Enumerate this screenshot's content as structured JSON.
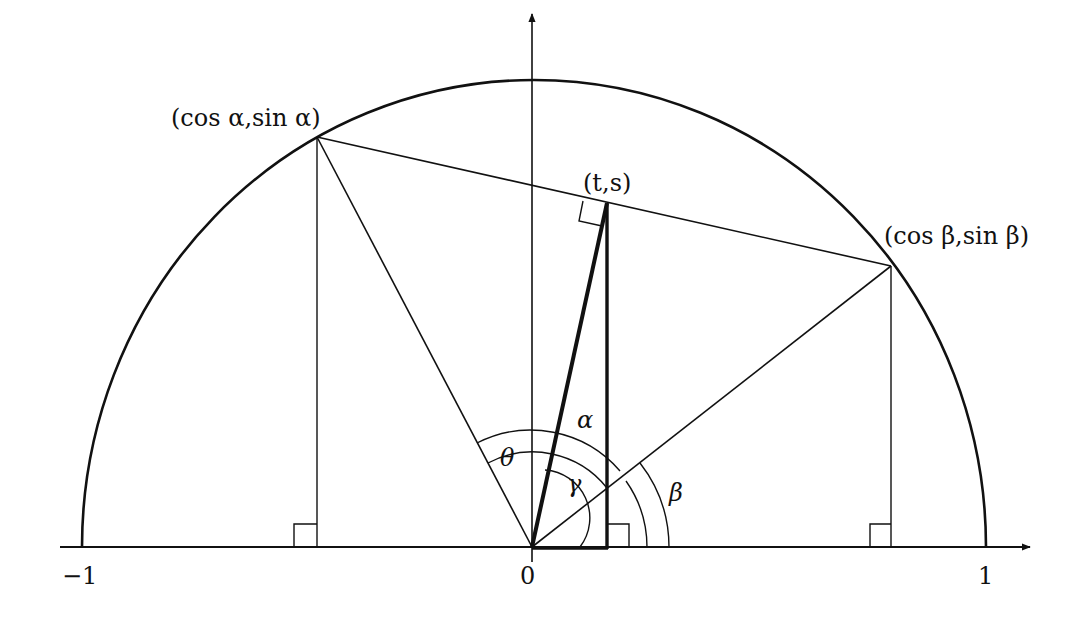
{
  "diagram": {
    "title": "",
    "colors": {
      "stroke": "#111111",
      "background": "#ffffff"
    },
    "axis_labels": {
      "x_min": "−1",
      "x_origin": "0",
      "x_max": "1"
    },
    "point_labels": {
      "alpha_point": "(cos α,sin α)",
      "t_s_point": "(t,s)",
      "beta_point": "(cos β,sin β)"
    },
    "angle_labels": {
      "theta": "θ",
      "alpha": "α",
      "gamma": "γ",
      "beta": "β"
    }
  }
}
